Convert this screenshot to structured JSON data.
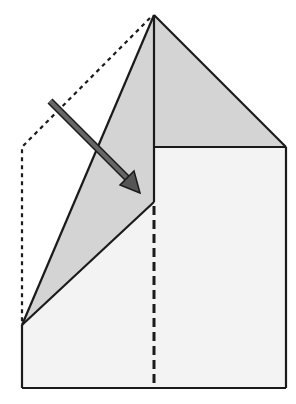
{
  "diagram": {
    "type": "paper-folding-step",
    "description": "Fold the left flap along the diagonal so the left edge meets the center line",
    "colors": {
      "background": "#ffffff",
      "paper_light": "#f3f3f3",
      "paper_shaded": "#d4d4d4",
      "outline": "#1a1a1a",
      "arrow": "#555555"
    },
    "elements": {
      "top_triangle": "shaded triangle at top right",
      "right_panel": "light rectangle right half",
      "left_flap": "shaded folded flap",
      "center_crease": "dashed vertical valley-fold line",
      "previous_position": "dotted outline of unfolded flap",
      "arrow": "fold direction arrow"
    }
  }
}
